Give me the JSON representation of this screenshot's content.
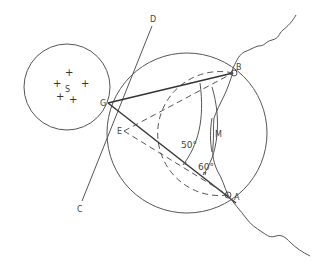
{
  "diagram": {
    "points": {
      "A": {
        "label": "A",
        "x": 228,
        "y": 195
      },
      "B": {
        "label": "B",
        "x": 233,
        "y": 73
      },
      "G": {
        "label": "G",
        "x": 108,
        "y": 103
      },
      "E": {
        "label": "E",
        "x": 124,
        "y": 131
      },
      "D": {
        "label": "D",
        "x": 153,
        "y": 19
      },
      "C": {
        "label": "C",
        "x": 80,
        "y": 209
      },
      "S": {
        "label": "S",
        "x": 67,
        "y": 87
      },
      "M": {
        "label": "M",
        "x": 217,
        "y": 134
      }
    },
    "angles": {
      "angle_50": "50°",
      "angle_60": "60°"
    },
    "circles": {
      "star_circle": {
        "cx": 67,
        "cy": 87,
        "r": 43
      },
      "large_circle": {
        "cx": 187,
        "cy": 133,
        "r": 80
      },
      "dashed_circle": {
        "cx": 181,
        "cy": 134,
        "r": 57
      }
    },
    "stars": [
      "+",
      "+",
      "+",
      "+",
      "+"
    ]
  }
}
